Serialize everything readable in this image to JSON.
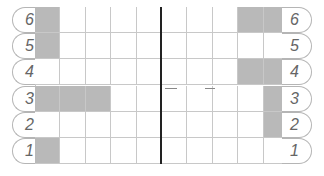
{
  "board": {
    "rows": [
      {
        "label": "6",
        "shaded": [
          0,
          8,
          9
        ]
      },
      {
        "label": "5",
        "shaded": [
          0
        ]
      },
      {
        "label": "4",
        "shaded": [
          8,
          9
        ]
      },
      {
        "label": "3",
        "shaded": [
          0,
          1,
          2,
          9
        ]
      },
      {
        "label": "2",
        "shaded": [
          9
        ]
      },
      {
        "label": "1",
        "shaded": [
          0
        ]
      }
    ],
    "columns": 10,
    "colors": {
      "shaded": "#b9b9b9",
      "grid": "#c8c8c8",
      "divider": "#222222"
    }
  }
}
